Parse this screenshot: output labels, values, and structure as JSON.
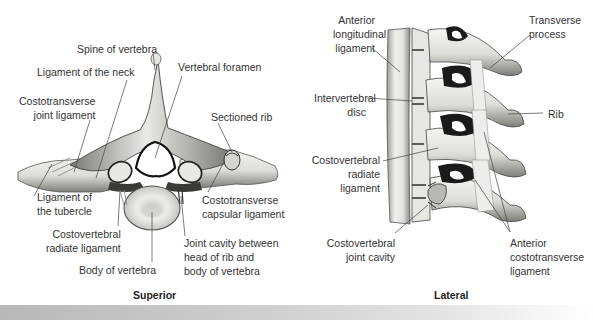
{
  "figure": {
    "panels": [
      {
        "id": "superior",
        "caption": "Superior",
        "labels": {
          "spine_of_vertebra": "Spine of vertebra",
          "ligament_of_the_neck": "Ligament of the neck",
          "vertebral_foramen": "Vertebral foramen",
          "costotransverse_joint_ligament": [
            "Costotransverse",
            "joint ligament"
          ],
          "sectioned_rib": "Sectioned rib",
          "ligament_of_the_tubercle": [
            "Ligament of",
            "the tubercle"
          ],
          "costotransverse_capsular_ligament": [
            "Costotransverse",
            "capsular ligament"
          ],
          "costovertebral_radiate_ligament": [
            "Costovertebral",
            "radiate ligament"
          ],
          "joint_cavity": [
            "Joint cavity between",
            "head of rib and",
            "body of vertebra"
          ],
          "body_of_vertebra": "Body of vertebra"
        }
      },
      {
        "id": "lateral",
        "caption": "Lateral",
        "labels": {
          "anterior_longitudinal_ligament": [
            "Anterior",
            "longitudinal",
            "ligament"
          ],
          "transverse_process": [
            "Transverse",
            "process"
          ],
          "intervertebral_disc": [
            "Intervertebral",
            "disc"
          ],
          "rib": "Rib",
          "costovertebral_radiate_ligament": [
            "Costovertebral",
            "radiate",
            "ligament"
          ],
          "costovertebral_joint_cavity": [
            "Costovertebral",
            "joint cavity"
          ],
          "anterior_costotransverse_ligament": [
            "Anterior",
            "costotransverse",
            "ligament"
          ]
        }
      }
    ],
    "colors": {
      "bone_light": "#f1f1ef",
      "bone_mid": "#c9c9c6",
      "bone_dark": "#5a5a58",
      "shadow": "#1e1e1e",
      "leader_line": "#444444",
      "text": "#333333",
      "bar_start": "#b8b8b8",
      "bar_end": "#ffffff"
    }
  }
}
